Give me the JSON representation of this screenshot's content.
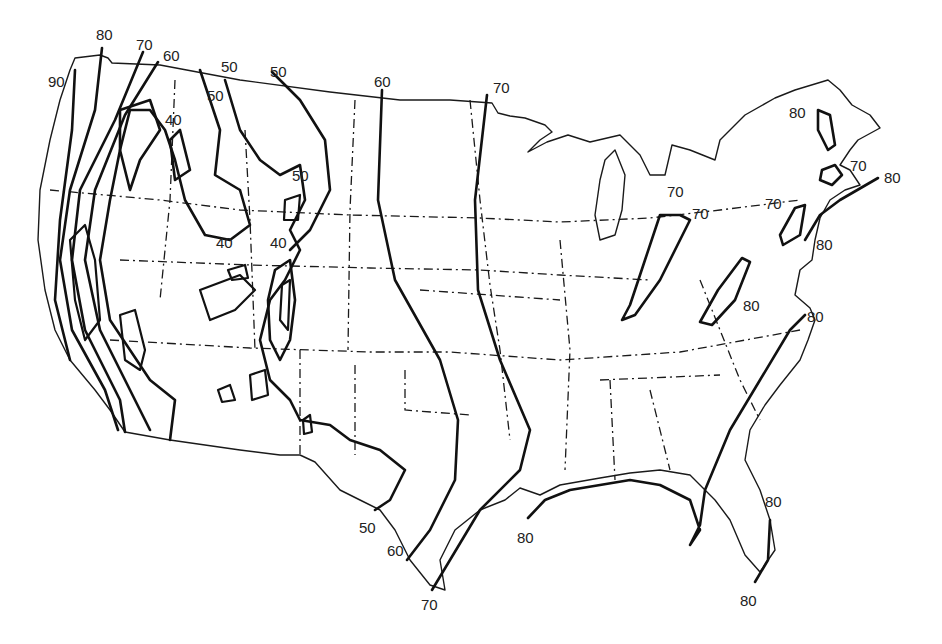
{
  "map": {
    "subject": "Contiguous United States isoline map",
    "line_color": "#111111",
    "background": "#ffffff",
    "isoline_values": [
      40,
      50,
      60,
      70,
      80,
      90
    ],
    "labels": [
      {
        "text": "80",
        "x": 96,
        "y": 27
      },
      {
        "text": "70",
        "x": 136,
        "y": 37
      },
      {
        "text": "90",
        "x": 48,
        "y": 74
      },
      {
        "text": "60",
        "x": 163,
        "y": 48
      },
      {
        "text": "50",
        "x": 221,
        "y": 59
      },
      {
        "text": "50",
        "x": 270,
        "y": 64
      },
      {
        "text": "50",
        "x": 207,
        "y": 88
      },
      {
        "text": "40",
        "x": 165,
        "y": 112
      },
      {
        "text": "50",
        "x": 292,
        "y": 168
      },
      {
        "text": "40",
        "x": 216,
        "y": 235
      },
      {
        "text": "40",
        "x": 270,
        "y": 235
      },
      {
        "text": "60",
        "x": 374,
        "y": 74
      },
      {
        "text": "70",
        "x": 493,
        "y": 80
      },
      {
        "text": "70",
        "x": 667,
        "y": 184
      },
      {
        "text": "70",
        "x": 692,
        "y": 206
      },
      {
        "text": "70",
        "x": 765,
        "y": 196
      },
      {
        "text": "80",
        "x": 789,
        "y": 105
      },
      {
        "text": "70",
        "x": 850,
        "y": 158
      },
      {
        "text": "80",
        "x": 884,
        "y": 170
      },
      {
        "text": "80",
        "x": 816,
        "y": 237
      },
      {
        "text": "80",
        "x": 743,
        "y": 298
      },
      {
        "text": "80",
        "x": 807,
        "y": 309
      },
      {
        "text": "50",
        "x": 359,
        "y": 520
      },
      {
        "text": "60",
        "x": 387,
        "y": 543
      },
      {
        "text": "70",
        "x": 421,
        "y": 597
      },
      {
        "text": "80",
        "x": 517,
        "y": 530
      },
      {
        "text": "80",
        "x": 765,
        "y": 494
      },
      {
        "text": "80",
        "x": 740,
        "y": 593
      }
    ]
  },
  "caption": {
    "text": ""
  }
}
